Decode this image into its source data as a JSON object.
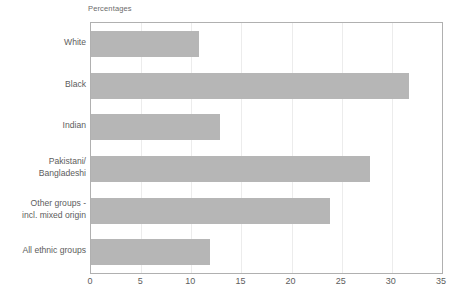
{
  "chart_data": {
    "type": "bar",
    "orientation": "horizontal",
    "title": "Percentages",
    "xlabel": "",
    "ylabel": "",
    "xlim": [
      0,
      35
    ],
    "xticks": [
      0,
      5,
      10,
      15,
      20,
      25,
      30,
      35
    ],
    "grid": "vertical",
    "legend": null,
    "bar_color": "#b6b6b6",
    "categories": [
      "White",
      "Black",
      "Indian",
      "Pakistani/\nBangladeshi",
      "Other groups -\nincl. mixed origin",
      "All ethnic groups"
    ],
    "values": [
      10.8,
      31.7,
      12.9,
      27.8,
      23.8,
      11.9
    ],
    "series": [
      {
        "name": "Percentages",
        "values": [
          10.8,
          31.7,
          12.9,
          27.8,
          23.8,
          11.9
        ]
      }
    ]
  },
  "axis": {
    "tick_labels": [
      "0",
      "5",
      "10",
      "15",
      "20",
      "25",
      "30",
      "35"
    ]
  }
}
